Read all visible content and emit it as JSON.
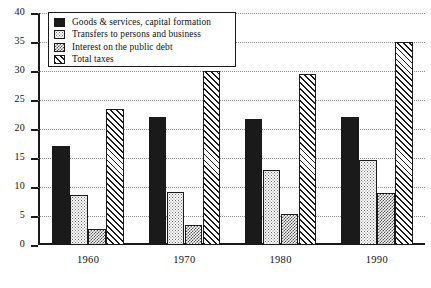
{
  "chart_data": {
    "type": "bar",
    "title": "",
    "xlabel": "",
    "ylabel": "",
    "categories": [
      "1960",
      "1970",
      "1980",
      "1990"
    ],
    "ylim": [
      0,
      40
    ],
    "yticks": [
      0,
      5,
      10,
      15,
      20,
      25,
      30,
      35,
      40
    ],
    "grid": true,
    "legend_position": "top-left-inside",
    "series": [
      {
        "name": "Goods & services, capital formation",
        "pattern": "solid-black",
        "color": "#1a1a1a",
        "values": [
          17,
          22,
          21.8,
          22.1
        ]
      },
      {
        "name": "Transfers to persons and business",
        "pattern": "light-dots",
        "color": "#d9d9d9",
        "values": [
          8.7,
          9.2,
          13,
          14.7
        ]
      },
      {
        "name": "Interest on the public debt",
        "pattern": "dark-checker",
        "color": "#808080",
        "values": [
          2.7,
          3.5,
          5.4,
          9
        ]
      },
      {
        "name": "Total taxes",
        "pattern": "diagonal-hatch",
        "color": "#ffffff",
        "values": [
          23.5,
          30,
          29.5,
          35
        ]
      }
    ]
  },
  "axis": {
    "y_tick_labels": [
      "40",
      "35",
      "30",
      "25",
      "20",
      "15",
      "10",
      "5",
      "0"
    ],
    "x_tick_labels": [
      "1960",
      "1970",
      "1980",
      "1990"
    ]
  },
  "legend": {
    "items": [
      {
        "label": "Goods & services, capital formation"
      },
      {
        "label": "Transfers to persons and business"
      },
      {
        "label": "Interest on the public debt"
      },
      {
        "label": "Total taxes"
      }
    ]
  }
}
